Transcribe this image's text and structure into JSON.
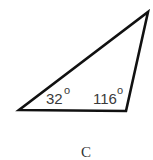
{
  "figure": {
    "shape": "triangle",
    "vertices": {
      "left": [
        19,
        110
      ],
      "bottom_right": [
        126,
        111
      ],
      "top_right": [
        148,
        12
      ]
    },
    "angles": [
      {
        "vertex": "left",
        "value": "32",
        "unit": "o"
      },
      {
        "vertex": "bottom_right",
        "value": "116",
        "unit": "o"
      }
    ],
    "caption": "C",
    "stroke_color": "#111111",
    "label_color": "#3a3a3a"
  }
}
